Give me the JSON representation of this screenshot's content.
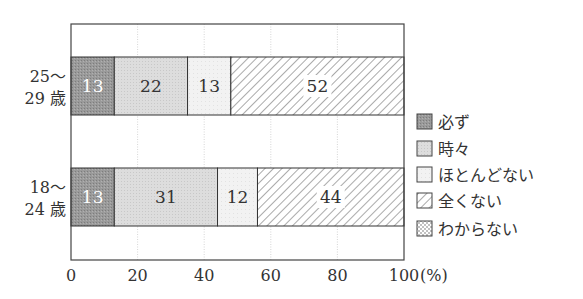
{
  "chart_data": {
    "type": "bar",
    "orientation": "horizontal",
    "stacked": true,
    "title": "",
    "xlabel": "(%)",
    "ylabel": "",
    "xlim": [
      0,
      100
    ],
    "xticks": [
      0,
      20,
      40,
      60,
      80,
      100
    ],
    "grid": "vertical dotted lines at 20, 40, 60, 80",
    "legend_position": "right",
    "categories": [
      "25〜\n29歳",
      "18〜\n24歳"
    ],
    "category_lines": [
      [
        "25〜",
        "29 歳"
      ],
      [
        "18〜",
        "24 歳"
      ]
    ],
    "series": [
      {
        "name": "必ず",
        "values": [
          13,
          13
        ],
        "pattern": "dark-gray",
        "label_color": "#ffffff"
      },
      {
        "name": "時々",
        "values": [
          22,
          31
        ],
        "pattern": "light-gray",
        "label_color": "#333333"
      },
      {
        "name": "ほとんどない",
        "values": [
          13,
          12
        ],
        "pattern": "very-light-gray",
        "label_color": "#333333"
      },
      {
        "name": "全くない",
        "values": [
          52,
          44
        ],
        "pattern": "diagonal-hatch",
        "label_color": "#333333"
      },
      {
        "name": "わからない",
        "values": [
          0,
          0
        ],
        "pattern": "dots",
        "label_color": "#333333"
      }
    ]
  },
  "axis": {
    "unit_label": "(%)"
  },
  "colors": {
    "always": "#9a9a9a",
    "sometimes": "#dcdcdc",
    "rarely": "#f0f0f0",
    "never_hatch": "#555555",
    "axis": "#444444",
    "grid": "#cccccc"
  }
}
